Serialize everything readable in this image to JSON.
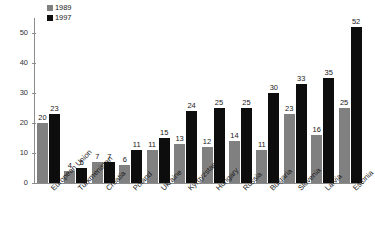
{
  "chart_data": {
    "type": "bar",
    "title": "",
    "subtitle": "",
    "xlabel": "",
    "ylabel": "",
    "ylim": [
      0,
      55
    ],
    "yticks": [
      0,
      10,
      20,
      30,
      40,
      50
    ],
    "grid": false,
    "legend_position": "top-left",
    "categories": [
      "European Union",
      "Turkmenistan",
      "Croatia",
      "Poland",
      "Ukraine",
      "Kyrgyzstan",
      "Hungary",
      "Russia",
      "Bulgaria",
      "Slovenia",
      "Latvia",
      "Estonia"
    ],
    "series": [
      {
        "name": "1989",
        "color": "#808080",
        "values": [
          20,
          4,
          7,
          6,
          11,
          13,
          12,
          14,
          11,
          23,
          16,
          25
        ]
      },
      {
        "name": "1997",
        "color": "#0d0d0d",
        "values": [
          23,
          5,
          7,
          11,
          15,
          24,
          25,
          25,
          30,
          33,
          35,
          52
        ]
      }
    ]
  },
  "legend": {
    "items": [
      {
        "label": "1989",
        "color": "#808080"
      },
      {
        "label": "1997",
        "color": "#0d0d0d"
      }
    ]
  },
  "footnote": {
    "text": ""
  }
}
